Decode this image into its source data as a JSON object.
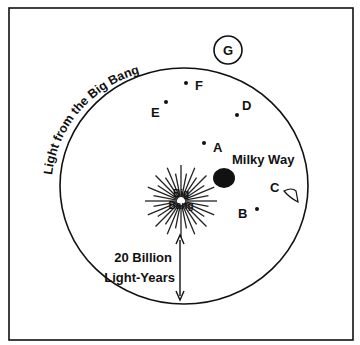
{
  "diagram": {
    "arc_label": "Light from the Big Bang",
    "big_bang_label_line1": "Big",
    "big_bang_label_line2": "Bang",
    "milky_way_label": "Milky Way",
    "distance_line1": "20 Billion",
    "distance_line2": "Light-Years",
    "points": {
      "A": "A",
      "B": "B",
      "C": "C",
      "D": "D",
      "E": "E",
      "F": "F",
      "G": "G"
    },
    "colors": {
      "ink": "#111111",
      "background": "#ffffff"
    }
  }
}
